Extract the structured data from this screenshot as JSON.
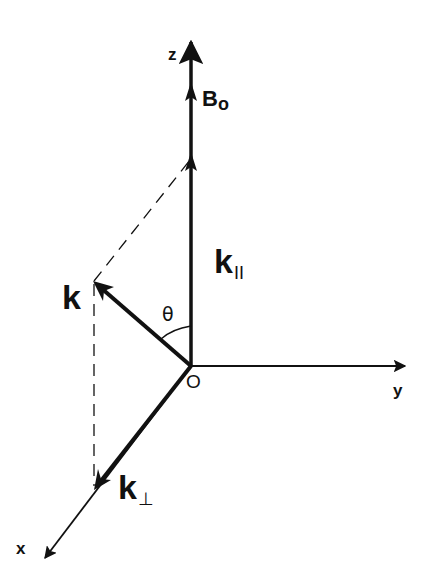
{
  "diagram": {
    "colors": {
      "ink": "#111111",
      "background": "#ffffff"
    },
    "axes": {
      "z": {
        "label": "z"
      },
      "y": {
        "label": "y"
      },
      "x": {
        "label": "x"
      },
      "origin": {
        "label": "O"
      }
    },
    "vectors": {
      "b0": {
        "label": "B",
        "subscript": "o"
      },
      "k": {
        "label": "k"
      },
      "k_parallel": {
        "label": "k",
        "subscript": "II"
      },
      "k_perp": {
        "label": "k",
        "subscript": "⊥"
      }
    },
    "angle": {
      "label": "θ"
    }
  }
}
